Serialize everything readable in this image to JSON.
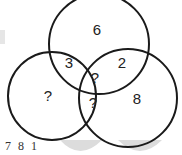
{
  "diagram": {
    "type": "venn-3-circle-puzzle",
    "regions": {
      "top_only": "6",
      "top_left": "3",
      "top_right": "2",
      "center": "?",
      "left_only": "?",
      "left_right": "?",
      "right_only": "8"
    },
    "footer_text": "7  8  1",
    "stroke_color": "#1a1a1a",
    "watermark_color": "#d9d9d9"
  }
}
